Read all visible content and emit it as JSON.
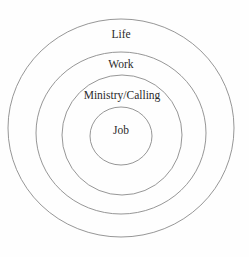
{
  "diagram": {
    "type": "concentric-circles",
    "background_color": "#fefefe",
    "stroke_color": "#8a8a8a",
    "text_color": "#2b2b2b",
    "rings": [
      {
        "id": "life",
        "label": "Life",
        "level": 1,
        "cx": 121,
        "cy": 128,
        "rx": 113,
        "ry": 109,
        "label_x": 121,
        "label_y": 35
      },
      {
        "id": "work",
        "label": "Work",
        "level": 2,
        "cx": 121,
        "cy": 133,
        "rx": 85,
        "ry": 81,
        "label_x": 121,
        "label_y": 65
      },
      {
        "id": "ministry-calling",
        "label": "Ministry/Calling",
        "level": 3,
        "cx": 122,
        "cy": 135,
        "rx": 60,
        "ry": 60,
        "label_x": 122,
        "label_y": 96
      },
      {
        "id": "job",
        "label": "Job",
        "level": 4,
        "cx": 121,
        "cy": 136,
        "rx": 31,
        "ry": 29,
        "label_x": 121,
        "label_y": 131
      }
    ]
  },
  "chart_data": {
    "type": "diagram",
    "subtype": "concentric-circles",
    "title": "",
    "categories": [
      "Life",
      "Work",
      "Ministry/Calling",
      "Job"
    ],
    "values": [
      113,
      85,
      60,
      31
    ],
    "xlabel": "",
    "ylabel": "",
    "legend": [],
    "annotations": [
      "Life",
      "Work",
      "Ministry/Calling",
      "Job"
    ]
  }
}
